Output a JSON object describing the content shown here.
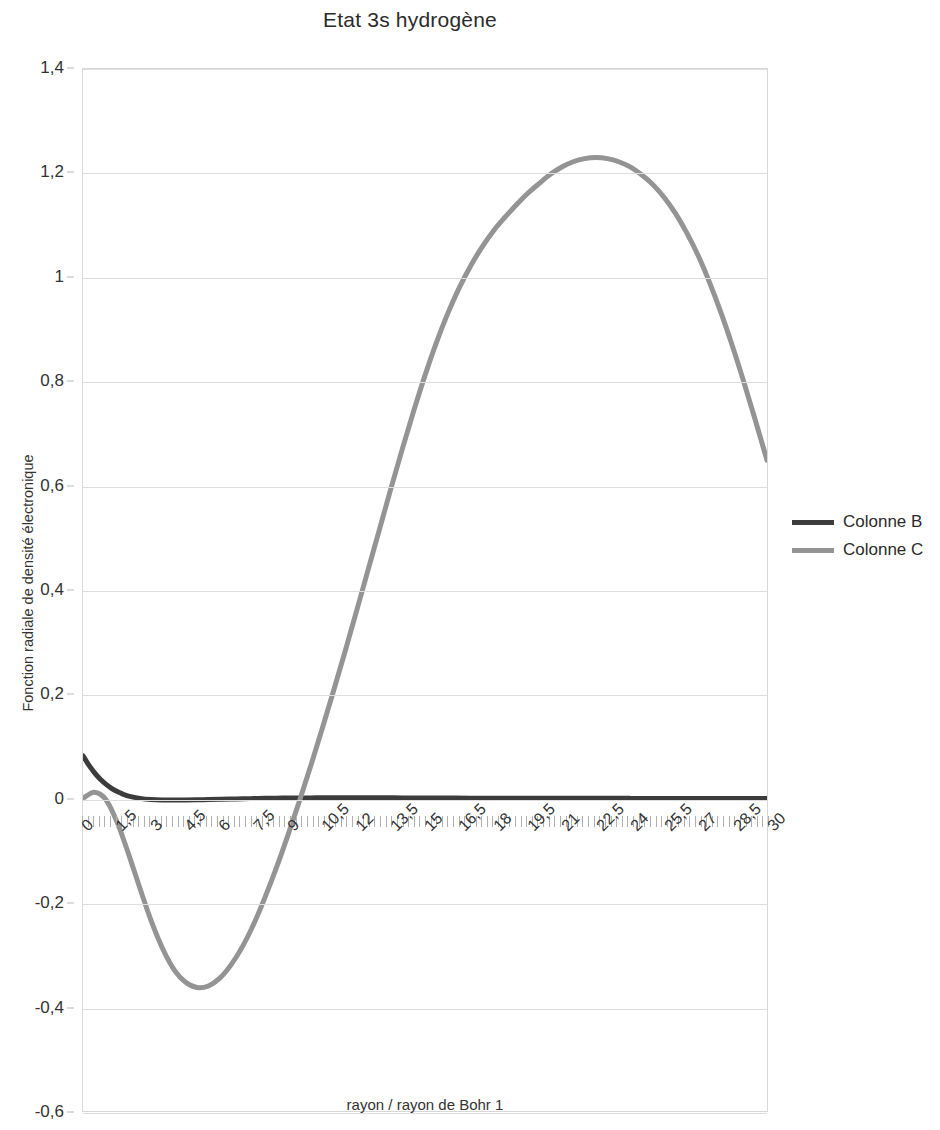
{
  "chart_data": {
    "type": "line",
    "title": "Etat 3s hydrogène",
    "xlabel": "rayon / rayon de Bohr 1",
    "ylabel": "Fonction radiale de densité électronique",
    "xlim": [
      0,
      30
    ],
    "ylim": [
      -0.6,
      1.4
    ],
    "grid": true,
    "legend_position": "right",
    "x_ticks": [
      "0",
      "1,5",
      "3",
      "4,5",
      "6",
      "7,5",
      "9",
      "10,5",
      "12",
      "13,5",
      "15",
      "16,5",
      "18",
      "19,5",
      "21",
      "22,5",
      "24",
      "25,5",
      "27",
      "28,5",
      "30"
    ],
    "x_tick_values": [
      0,
      1.5,
      3,
      4.5,
      6,
      7.5,
      9,
      10.5,
      12,
      13.5,
      15,
      16.5,
      18,
      19.5,
      21,
      22.5,
      24,
      25.5,
      27,
      28.5,
      30
    ],
    "y_ticks": [
      "1,4",
      "1,2",
      "1",
      "0,8",
      "0,6",
      "0,4",
      "0,2",
      "0",
      "-0,2",
      "-0,4",
      "-0,6"
    ],
    "y_tick_values": [
      1.4,
      1.2,
      1.0,
      0.8,
      0.6,
      0.4,
      0.2,
      0,
      -0.2,
      -0.4,
      -0.6
    ],
    "series": [
      {
        "name": "Colonne B",
        "color": "#3c3c3c",
        "width": 5,
        "x": [
          0,
          0.25,
          0.5,
          0.75,
          1,
          1.25,
          1.5,
          1.75,
          2,
          2.5,
          3,
          3.5,
          4,
          4.5,
          5,
          5.5,
          6,
          6.5,
          7,
          7.5,
          8,
          8.5,
          9,
          9.5,
          10,
          10.5,
          11,
          11.5,
          12,
          12.5,
          13,
          13.5,
          14,
          15,
          16,
          17,
          18,
          19,
          20,
          21,
          22,
          23,
          24,
          25,
          26,
          27,
          28,
          29,
          30
        ],
        "y": [
          0.0817,
          0.0642,
          0.0495,
          0.0373,
          0.0274,
          0.0194,
          0.0131,
          0.0082,
          0.0045,
          0.0001,
          -0.0022,
          -0.0031,
          -0.0033,
          -0.0031,
          -0.0027,
          -0.0022,
          -0.0017,
          -0.0012,
          -0.0007,
          -0.0003,
          0.0001,
          0.0004,
          0.0007,
          0.0009,
          0.001,
          0.0012,
          0.0012,
          0.0013,
          0.0013,
          0.0012,
          0.0012,
          0.0011,
          0.001,
          0.0008,
          0.0006,
          0.0005,
          0.0004,
          0.0003,
          0.0002,
          0.00015,
          0.0001,
          8e-05,
          5e-05,
          4e-05,
          3e-05,
          2e-05,
          1e-05,
          1e-05,
          0.0
        ]
      },
      {
        "name": "Colonne C",
        "color": "#949494",
        "width": 5,
        "x": [
          0,
          0.5,
          1,
          1.5,
          2,
          2.5,
          3,
          3.5,
          4,
          4.5,
          5,
          5.5,
          6,
          6.5,
          7,
          7.5,
          8,
          8.5,
          9,
          9.5,
          10,
          10.5,
          11,
          11.5,
          12,
          12.5,
          13,
          13.5,
          14,
          14.5,
          15,
          15.5,
          16,
          16.5,
          17,
          17.5,
          18,
          18.5,
          19,
          19.5,
          20,
          20.5,
          21,
          21.5,
          22,
          22.5,
          23,
          23.5,
          24,
          24.5,
          25,
          25.5,
          26,
          26.5,
          27,
          27.5,
          28,
          28.5,
          29,
          29.5,
          30
        ],
        "y": [
          0.0,
          0.012,
          -0.002,
          -0.046,
          -0.107,
          -0.173,
          -0.236,
          -0.289,
          -0.329,
          -0.353,
          -0.363,
          -0.36,
          -0.345,
          -0.319,
          -0.284,
          -0.24,
          -0.188,
          -0.131,
          -0.069,
          -0.004,
          0.064,
          0.135,
          0.208,
          0.283,
          0.36,
          0.438,
          0.516,
          0.594,
          0.67,
          0.743,
          0.812,
          0.875,
          0.931,
          0.98,
          1.022,
          1.058,
          1.089,
          1.115,
          1.139,
          1.161,
          1.18,
          1.198,
          1.212,
          1.222,
          1.228,
          1.23,
          1.228,
          1.222,
          1.212,
          1.197,
          1.178,
          1.153,
          1.122,
          1.084,
          1.04,
          0.988,
          0.93,
          0.866,
          0.797,
          0.724,
          0.649
        ]
      }
    ],
    "annotations": {
      "colonne_c_peak_value": 1.23,
      "colonne_c_peak_x": 15,
      "colonne_c_min_value": -0.365,
      "colonne_c_min_x": 4.5,
      "colonne_b_start_value": 0.08
    }
  },
  "legend": {
    "entries": [
      {
        "label": "Colonne B",
        "color": "#3c3c3c"
      },
      {
        "label": "Colonne C",
        "color": "#949494"
      }
    ]
  }
}
